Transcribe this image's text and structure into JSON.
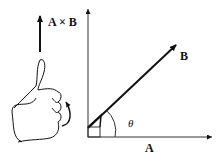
{
  "diagram": {
    "labels": {
      "cross_product": "A × B",
      "vector_a": "A",
      "vector_b": "B",
      "angle": "θ"
    },
    "icons": {
      "hand": "thumbs-up-right-hand-icon",
      "curl": "curl-arrow-icon"
    },
    "colors": {
      "stroke": "#111111",
      "background": "#ffffff"
    }
  }
}
